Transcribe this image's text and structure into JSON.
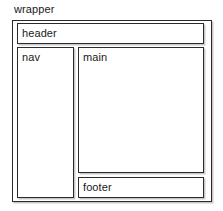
{
  "diagram": {
    "type": "css-layout-box-diagram",
    "title": "wrapper",
    "canvas": {
      "width": 223,
      "height": 211,
      "background_color": "#ffffff"
    },
    "style": {
      "border_color": "#2b2b2b",
      "shadow_color": "#c9c9c9",
      "box_fill": "#ffffff",
      "text_color": "#1a1a1a"
    },
    "regions": {
      "wrapper": {
        "label": "wrapper",
        "label_position": "outside-top-left"
      },
      "header": {
        "label": "header"
      },
      "nav": {
        "label": "nav"
      },
      "main": {
        "label": "main"
      },
      "footer": {
        "label": "footer"
      }
    }
  }
}
